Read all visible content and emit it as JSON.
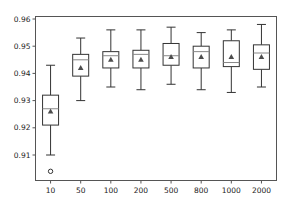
{
  "chart_data": {
    "type": "box",
    "title": "",
    "xlabel": "",
    "ylabel": "",
    "categories": [
      "10",
      "50",
      "100",
      "200",
      "500",
      "800",
      "1000",
      "2000"
    ],
    "ylim": [
      0.901,
      0.961
    ],
    "yticks": [
      0.91,
      0.92,
      0.93,
      0.94,
      0.95,
      0.96
    ],
    "ytick_labels": [
      "0.91",
      "0.92",
      "0.93",
      "0.94",
      "0.95",
      "0.96"
    ],
    "grid": false,
    "legend": null,
    "boxes": [
      {
        "label": "10",
        "whisker_low": 0.91,
        "q1": 0.921,
        "median": 0.927,
        "q3": 0.932,
        "whisker_high": 0.943,
        "mean": 0.926,
        "outliers": [
          0.904
        ]
      },
      {
        "label": "50",
        "whisker_low": 0.93,
        "q1": 0.939,
        "median": 0.945,
        "q3": 0.947,
        "whisker_high": 0.953,
        "mean": 0.942,
        "outliers": []
      },
      {
        "label": "100",
        "whisker_low": 0.935,
        "q1": 0.942,
        "median": 0.9465,
        "q3": 0.948,
        "whisker_high": 0.956,
        "mean": 0.945,
        "outliers": []
      },
      {
        "label": "200",
        "whisker_low": 0.934,
        "q1": 0.942,
        "median": 0.947,
        "q3": 0.9485,
        "whisker_high": 0.956,
        "mean": 0.945,
        "outliers": []
      },
      {
        "label": "500",
        "whisker_low": 0.936,
        "q1": 0.943,
        "median": 0.9465,
        "q3": 0.951,
        "whisker_high": 0.957,
        "mean": 0.946,
        "outliers": []
      },
      {
        "label": "800",
        "whisker_low": 0.934,
        "q1": 0.942,
        "median": 0.948,
        "q3": 0.95,
        "whisker_high": 0.955,
        "mean": 0.946,
        "outliers": []
      },
      {
        "label": "1000",
        "whisker_low": 0.933,
        "q1": 0.9425,
        "median": 0.944,
        "q3": 0.952,
        "whisker_high": 0.956,
        "mean": 0.946,
        "outliers": []
      },
      {
        "label": "2000",
        "whisker_low": 0.935,
        "q1": 0.9415,
        "median": 0.9475,
        "q3": 0.9505,
        "whisker_high": 0.958,
        "mean": 0.946,
        "outliers": []
      }
    ],
    "colors": {
      "box": "#333333",
      "median": "#888888",
      "mean_marker": "#4d4d4d",
      "axes": "#555555"
    }
  }
}
